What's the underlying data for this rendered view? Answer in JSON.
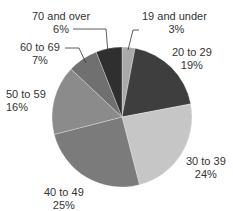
{
  "chart_data": {
    "type": "pie",
    "title": "",
    "start_angle": "12 o'clock, clockwise",
    "categories": [
      "19 and under",
      "20 to 29",
      "30 to 39",
      "40 to 49",
      "50 to 59",
      "60 to 69",
      "70 and over"
    ],
    "values": [
      3,
      19,
      24,
      25,
      16,
      7,
      6
    ],
    "value_labels": [
      "3%",
      "19%",
      "24%",
      "25%",
      "16%",
      "7%",
      "6%"
    ],
    "colors": [
      "#a9a9a9",
      "#3e3e3e",
      "#c6c6c6",
      "#7b7b7b",
      "#8b8b8b",
      "#707070",
      "#2f2f2f"
    ],
    "legend": "none (direct labels)",
    "unit": "%"
  },
  "labels": [
    {
      "name": "19 and under",
      "pct": "3%"
    },
    {
      "name": "20 to 29",
      "pct": "19%"
    },
    {
      "name": "30 to 39",
      "pct": "24%"
    },
    {
      "name": "40 to 49",
      "pct": "25%"
    },
    {
      "name": "50 to 59",
      "pct": "16%"
    },
    {
      "name": "60 to 69",
      "pct": "7%"
    },
    {
      "name": "70 and over",
      "pct": "6%"
    }
  ]
}
